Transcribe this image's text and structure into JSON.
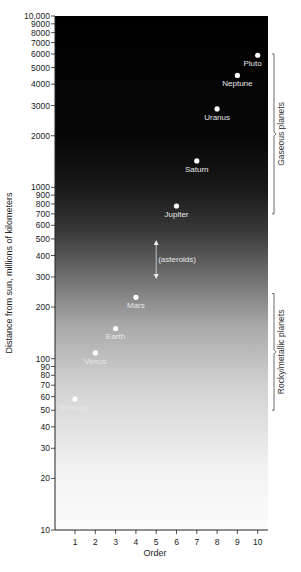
{
  "chart_data": {
    "type": "scatter",
    "title": "",
    "xlabel": "Order",
    "ylabel": "Distance from sun, millions of kilometers",
    "yscale": "log",
    "ylim": [
      10,
      10000
    ],
    "xlim": [
      0,
      10.3
    ],
    "grid": false,
    "x_ticks": [
      1,
      2,
      3,
      4,
      5,
      6,
      7,
      8,
      9,
      10
    ],
    "y_ticks": [
      10,
      20,
      30,
      40,
      50,
      60,
      70,
      80,
      90,
      100,
      200,
      300,
      400,
      500,
      600,
      700,
      800,
      900,
      1000,
      2000,
      3000,
      4000,
      5000,
      6000,
      7000,
      8000,
      9000,
      10000
    ],
    "y_tick_labels": [
      "10",
      "20",
      "30",
      "40",
      "50",
      "60",
      "70",
      "80",
      "90",
      "100",
      "200",
      "300",
      "400",
      "500",
      "600",
      "700",
      "800",
      "900",
      "1000",
      "2000",
      "3000",
      "4000",
      "5000",
      "6000",
      "7000",
      "8000",
      "9000",
      "10,000"
    ],
    "points": [
      {
        "label": "Mercury",
        "x": 1,
        "y": 58
      },
      {
        "label": "Venus",
        "x": 2,
        "y": 108
      },
      {
        "label": "Earth",
        "x": 3,
        "y": 150
      },
      {
        "label": "Mars",
        "x": 4,
        "y": 228
      },
      {
        "label": "Jupiter",
        "x": 6,
        "y": 778
      },
      {
        "label": "Saturn",
        "x": 7,
        "y": 1427
      },
      {
        "label": "Uranus",
        "x": 8,
        "y": 2870
      },
      {
        "label": "Neptune",
        "x": 9,
        "y": 4497
      },
      {
        "label": "Pluto",
        "x": 10,
        "y": 5900
      }
    ],
    "annotations": [
      {
        "text": "(asteroids)",
        "x": 5,
        "y_range": [
          300,
          480
        ]
      },
      {
        "text": "Gaseous planets",
        "bracket_y_range": [
          700,
          6000
        ]
      },
      {
        "text": "Rocky/metallic planets",
        "bracket_y_range": [
          50,
          240
        ]
      }
    ],
    "background": "vertical gradient from white (bottom) to black (top)"
  }
}
